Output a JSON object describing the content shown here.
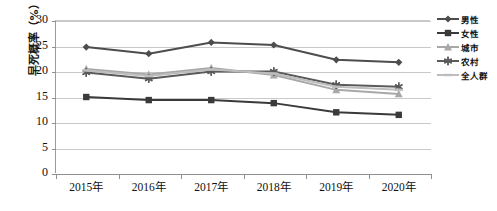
{
  "chart_data": {
    "type": "line",
    "title": "",
    "xlabel": "",
    "ylabel": "早死概率（%）",
    "categories": [
      "2015年",
      "2016年",
      "2017年",
      "2018年",
      "2019年",
      "2020年"
    ],
    "ylim": [
      0,
      30
    ],
    "ytick_values": [
      0,
      5,
      10,
      15,
      20,
      25,
      30
    ],
    "ytick_labels": [
      "0",
      "5",
      "10",
      "15",
      "20",
      "25",
      "30"
    ],
    "grid": true,
    "legend_position": "right",
    "series": [
      {
        "name": "男性",
        "marker": "diamond",
        "color": "#4d4d4d",
        "values": [
          24.7,
          23.4,
          25.6,
          25.1,
          22.2,
          21.7
        ]
      },
      {
        "name": "女性",
        "marker": "square",
        "color": "#3a3a3a",
        "values": [
          14.9,
          14.3,
          14.3,
          13.7,
          11.9,
          11.4
        ]
      },
      {
        "name": "城市",
        "marker": "triangle",
        "color": "#a8a8a8",
        "values": [
          20.4,
          19.3,
          20.6,
          19.2,
          16.3,
          15.5
        ]
      },
      {
        "name": "农村",
        "marker": "star",
        "color": "#5a5a5a",
        "values": [
          19.7,
          18.5,
          19.9,
          19.9,
          17.3,
          16.9
        ]
      },
      {
        "name": "全人群",
        "marker": "dash",
        "color": "#bdbdbd",
        "values": [
          20.1,
          19.0,
          20.3,
          19.5,
          16.9,
          16.3
        ]
      }
    ]
  },
  "caption": "",
  "colors": {
    "grid": "#c9c9c9",
    "axis": "#8f8f8f",
    "text": "#111111"
  }
}
